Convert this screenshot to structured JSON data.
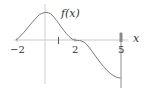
{
  "diagram": {
    "function_label": "f(x)",
    "x_axis_label": "x",
    "tick_labels": [
      {
        "text": "−2",
        "value": -2
      },
      {
        "text": "2",
        "value": 2
      },
      {
        "text": "5",
        "value": 5
      }
    ],
    "colors": {
      "axis": "#c8c8c8",
      "curve": "#7a7a7a",
      "text": "#333333",
      "marker": "#999999"
    }
  }
}
